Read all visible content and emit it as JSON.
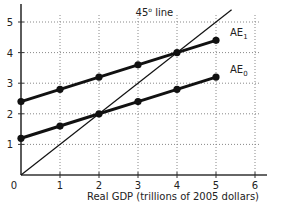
{
  "chart_data": {
    "type": "line",
    "title": "",
    "xlabel": "Real GDP (trillions of 2005 dollars)",
    "ylabel": "",
    "xlim": [
      0,
      6
    ],
    "ylim": [
      0,
      5
    ],
    "x_ticks": [
      "0",
      "1",
      "2",
      "3",
      "4",
      "5",
      "6"
    ],
    "y_ticks": [
      "1",
      "2",
      "3",
      "4",
      "5"
    ],
    "grid": true,
    "grid_style": "dotted",
    "x": [
      0,
      1,
      2,
      3,
      4,
      5
    ],
    "series": [
      {
        "name": "AE1",
        "label_main": "AE",
        "label_sub": "1",
        "values": [
          2.4,
          2.8,
          3.2,
          3.6,
          4.0,
          4.4
        ],
        "markers": true
      },
      {
        "name": "AE0",
        "label_main": "AE",
        "label_sub": "0",
        "values": [
          1.2,
          1.6,
          2.0,
          2.4,
          2.8,
          3.2
        ],
        "markers": true
      },
      {
        "name": "45° line",
        "x": [
          0,
          5.4
        ],
        "values": [
          0,
          5.4
        ],
        "markers": false
      }
    ],
    "annotations": [
      {
        "text": "45",
        "sup": "o",
        "rest": " line",
        "x": 3.4,
        "y": 5.0
      }
    ],
    "colors": {
      "line": "#111111",
      "grid": "#888888",
      "axis": "#333333"
    }
  }
}
